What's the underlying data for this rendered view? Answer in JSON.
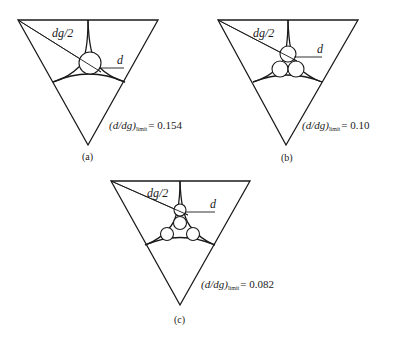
{
  "figure": {
    "panels": [
      {
        "id": "a",
        "caption": "(a)",
        "radius_label": "dg/2",
        "particle_label": "d",
        "ratio_prefix": "(d/dg)",
        "ratio_subscript": "limit",
        "ratio_value": "= 0.154",
        "particle_count": 1
      },
      {
        "id": "b",
        "caption": "(b)",
        "radius_label": "dg/2",
        "particle_label": "d",
        "ratio_prefix": "(d/dg)",
        "ratio_subscript": "limit",
        "ratio_value": "= 0.10",
        "particle_count": 3
      },
      {
        "id": "c",
        "caption": "(c)",
        "radius_label": "dg/2",
        "particle_label": "d",
        "ratio_prefix": "(d/dg)",
        "ratio_subscript": "limit",
        "ratio_value": "= 0.082",
        "particle_count": 4
      }
    ],
    "colors": {
      "line": "#1a1a1a",
      "background": "#ffffff"
    }
  }
}
